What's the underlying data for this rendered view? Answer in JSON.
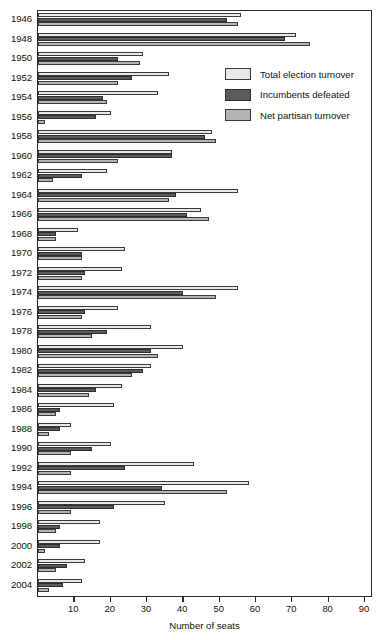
{
  "chart_data": {
    "type": "bar",
    "orientation": "horizontal",
    "title": "",
    "xlabel": "Number of seats",
    "ylabel": "",
    "xlim": [
      0,
      100
    ],
    "xticks": [
      10,
      20,
      30,
      40,
      50,
      60,
      70,
      80,
      90
    ],
    "grid": false,
    "legend_position": "upper right",
    "categories": [
      "1946",
      "1948",
      "1950",
      "1952",
      "1954",
      "1956",
      "1958",
      "1960",
      "1962",
      "1964",
      "1966",
      "1968",
      "1970",
      "1972",
      "1974",
      "1976",
      "1978",
      "1980",
      "1982",
      "1984",
      "1986",
      "1988",
      "1990",
      "1992",
      "1994",
      "1996",
      "1998",
      "2000",
      "2002",
      "2004"
    ],
    "series": [
      {
        "name": "Total election turnover",
        "color": "#e8e8e8",
        "values": [
          56,
          71,
          29,
          36,
          33,
          20,
          48,
          37,
          19,
          55,
          45,
          11,
          24,
          23,
          55,
          22,
          31,
          40,
          31,
          23,
          21,
          9,
          20,
          43,
          58,
          35,
          17,
          17,
          13,
          12
        ]
      },
      {
        "name": "Incumbents defeated",
        "color": "#5b5b5b",
        "values": [
          52,
          68,
          22,
          26,
          18,
          16,
          46,
          37,
          12,
          38,
          41,
          5,
          12,
          13,
          40,
          13,
          19,
          31,
          29,
          16,
          6,
          6,
          15,
          24,
          34,
          21,
          6,
          6,
          8,
          7
        ]
      },
      {
        "name": "Net partisan turnover",
        "color": "#b4b4b4",
        "values": [
          55,
          75,
          28,
          22,
          19,
          2,
          49,
          22,
          4,
          36,
          47,
          5,
          12,
          12,
          49,
          12,
          15,
          33,
          26,
          14,
          5,
          3,
          9,
          9,
          52,
          9,
          5,
          2,
          5,
          3
        ]
      }
    ]
  },
  "axis": {
    "x_title": "Number of seats",
    "tick_labels": [
      "10",
      "20",
      "30",
      "40",
      "50",
      "60",
      "70",
      "80",
      "90"
    ]
  },
  "legend": {
    "items": [
      {
        "label": "Total election turnover",
        "swatch": "total"
      },
      {
        "label": "Incumbents defeated",
        "swatch": "incumbents"
      },
      {
        "label": "Net partisan turnover",
        "swatch": "netpartisan"
      }
    ]
  }
}
